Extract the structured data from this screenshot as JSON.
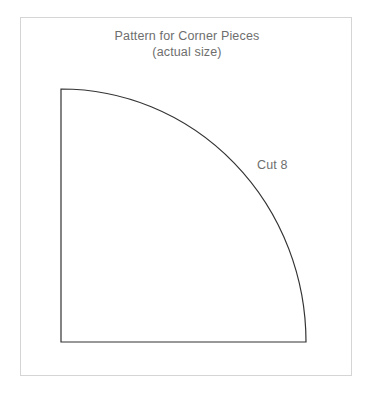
{
  "page": {
    "background_color": "#ffffff",
    "width": 372,
    "height": 398
  },
  "frame": {
    "border_color": "#d5d5d5"
  },
  "title": {
    "line1": "Pattern for Corner Pieces",
    "line2": "(actual size)",
    "color": "#6e6e6e"
  },
  "labels": {
    "cut": "Cut 8",
    "color": "#6e6e6e"
  },
  "pattern": {
    "name": "quarter-circle-corner-piece",
    "outline_color": "#333333",
    "stroke_width": 1.2,
    "fill": "none",
    "corner_x": 40,
    "corner_y": 71,
    "width": 245,
    "height": 253,
    "arc_start_x": 40,
    "arc_start_y": 71,
    "arc_end_x": 285,
    "arc_end_y": 324,
    "bottom_right_x": 285,
    "bottom_left_x": 40,
    "baseline_y": 324
  }
}
